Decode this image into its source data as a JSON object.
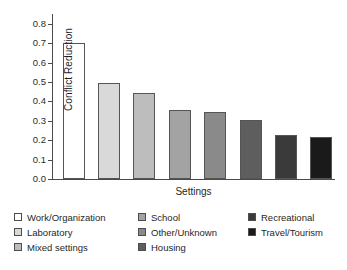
{
  "chart_data": {
    "type": "bar",
    "title": "",
    "xlabel": "Settings",
    "ylabel": "Conflict Reduction",
    "categories": [
      "Work/Organization",
      "Laboratory",
      "Mixed settings",
      "School",
      "Other/Unknown",
      "Housing",
      "Recreational",
      "Travel/Tourism"
    ],
    "values": [
      0.7,
      0.495,
      0.445,
      0.355,
      0.345,
      0.305,
      0.225,
      0.215
    ],
    "ylim": [
      0.0,
      0.85
    ],
    "yticks": [
      0.0,
      0.1,
      0.2,
      0.3,
      0.4,
      0.5,
      0.6,
      0.7,
      0.8
    ],
    "ytick_labels": [
      "0.0",
      "0.1",
      "0.2",
      "0.3",
      "0.4",
      "0.5",
      "0.6",
      "0.7",
      "0.8"
    ],
    "grid": false,
    "legend_position": "below",
    "bar_colors": [
      "#ffffff",
      "#d9d9d9",
      "#bdbdbd",
      "#a3a3a3",
      "#8a8a8a",
      "#5e5e5e",
      "#3a3a3a",
      "#1a1a1a"
    ],
    "bar_edge_color": "#555555",
    "axis_color": "#4a4a4a"
  },
  "legend": {
    "columns": [
      {
        "items": [
          {
            "label": "Work/Organization",
            "color": "#ffffff"
          },
          {
            "label": "Laboratory",
            "color": "#d9d9d9"
          },
          {
            "label": "Mixed settings",
            "color": "#bdbdbd"
          }
        ]
      },
      {
        "items": [
          {
            "label": "School",
            "color": "#a3a3a3"
          },
          {
            "label": "Other/Unknown",
            "color": "#8a8a8a"
          },
          {
            "label": "Housing",
            "color": "#5e5e5e"
          }
        ]
      },
      {
        "items": [
          {
            "label": "Recreational",
            "color": "#3a3a3a"
          },
          {
            "label": "Travel/Tourism",
            "color": "#1a1a1a"
          }
        ]
      }
    ]
  }
}
